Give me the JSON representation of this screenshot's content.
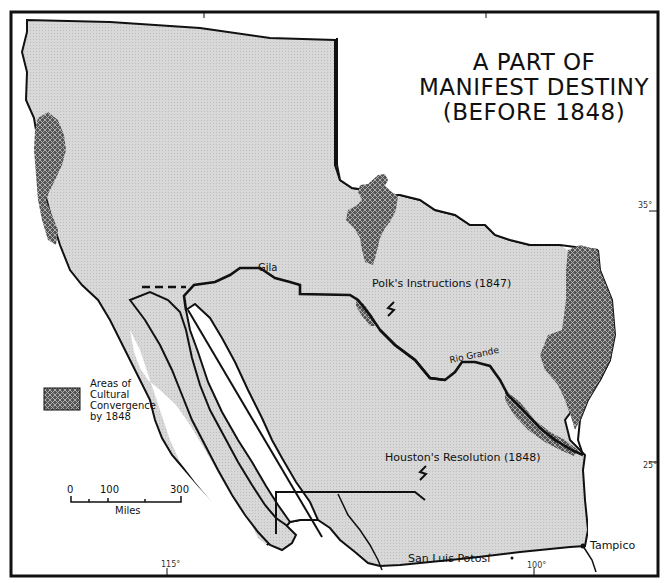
{
  "title": {
    "line1": "A PART OF",
    "line2": "MANIFEST DESTINY",
    "line3": "(BEFORE 1848)"
  },
  "legend": {
    "swatch_pattern": "crosshatch-dark",
    "line1": "Areas of",
    "line2": "Cultural",
    "line3": "Convergence",
    "line4": "by 1848"
  },
  "scale_bar": {
    "ticks": [
      "0",
      "100",
      "300"
    ],
    "unit": "Miles"
  },
  "labels": {
    "gila": "Gila",
    "rio_grande": "Rio Grande",
    "polks_instructions": "Polk's Instructions (1847)",
    "houstons_resolution": "Houston's Resolution (1848)",
    "san_luis_potosi": "San Luis Potosí",
    "tampico": "Tampico"
  },
  "graticule": {
    "lat_35": "35°",
    "lat_25": "25°",
    "lon_115": "115°",
    "lon_100": "100°"
  },
  "colors": {
    "land_fill": "#d4d4d4",
    "convergence_fill": "#6a6a6a",
    "line": "#111111",
    "background": "#ffffff"
  }
}
